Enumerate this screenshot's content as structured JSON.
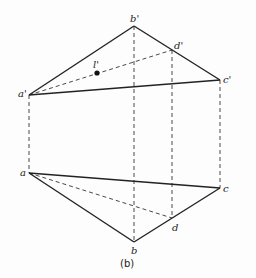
{
  "figure": {
    "caption": "(b)",
    "labels": {
      "a_prime": "a'",
      "b_prime": "b'",
      "c_prime": "c'",
      "d_prime": "d'",
      "l_prime": "l'",
      "a": "a",
      "b": "b",
      "c": "c",
      "d": "d"
    },
    "points": {
      "a_prime": [
        29,
        95
      ],
      "b_prime": [
        134,
        26
      ],
      "c_prime": [
        220,
        80
      ],
      "d_prime": [
        172,
        50
      ],
      "l_prime": [
        97,
        72
      ],
      "a": [
        29,
        173
      ],
      "b": [
        134,
        242
      ],
      "c": [
        220,
        188
      ],
      "d": [
        172,
        218
      ]
    },
    "line_color": "#222222"
  }
}
